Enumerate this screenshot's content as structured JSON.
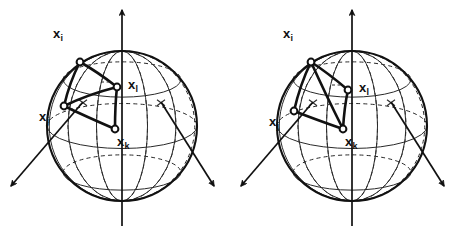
{
  "figure": {
    "name": "sphere-point-configuration-pair",
    "background_color": "#ffffff",
    "ink_color": "#111111",
    "width": 462,
    "height": 232,
    "panel_count": 2
  },
  "labels": {
    "xi": {
      "base": "x",
      "sub": "i"
    },
    "xj": {
      "base": "x",
      "sub": "j"
    },
    "xk": {
      "base": "x",
      "sub": "k"
    },
    "xl": {
      "base": "x",
      "sub": "l"
    }
  },
  "panels": [
    {
      "id": "left-panel",
      "name": "left-sphere-panel",
      "sphere": {
        "cx": 122,
        "cy": 126,
        "r": 75
      },
      "axes": [
        {
          "name": "vertical-axis",
          "from": [
            122,
            226
          ],
          "to": [
            122,
            10
          ]
        },
        {
          "name": "left-diagonal-axis",
          "from": [
            83,
            102
          ],
          "to": [
            11,
            186
          ]
        },
        {
          "name": "right-diagonal-axis",
          "from": [
            161,
            102
          ],
          "to": [
            214,
            186
          ]
        }
      ],
      "vertices": [
        {
          "key": "xi",
          "name": "vertex-xi",
          "x": 80,
          "y": 62,
          "label_x": 53,
          "label_y": 27
        },
        {
          "key": "xl",
          "name": "vertex-xl",
          "x": 117,
          "y": 87,
          "label_x": 128,
          "label_y": 78
        },
        {
          "key": "xj",
          "name": "vertex-xj",
          "x": 64,
          "y": 106,
          "label_x": 39,
          "label_y": 110
        },
        {
          "key": "xk",
          "name": "vertex-xk",
          "x": 115,
          "y": 129,
          "label_x": 117,
          "label_y": 135
        }
      ],
      "edges": [
        {
          "name": "edge-xi-xl",
          "from": "xi",
          "to": "xl"
        },
        {
          "name": "edge-xi-xj",
          "from": "xi",
          "to": "xj"
        },
        {
          "name": "edge-xj-xl",
          "from": "xj",
          "to": "xl"
        },
        {
          "name": "edge-xl-xk",
          "from": "xl",
          "to": "xk"
        },
        {
          "name": "edge-xj-xk",
          "from": "xj",
          "to": "xk"
        }
      ]
    },
    {
      "id": "right-panel",
      "name": "right-sphere-panel",
      "sphere": {
        "cx": 352,
        "cy": 126,
        "r": 75
      },
      "axes": [
        {
          "name": "vertical-axis",
          "from": [
            352,
            226
          ],
          "to": [
            352,
            10
          ]
        },
        {
          "name": "left-diagonal-axis",
          "from": [
            313,
            102
          ],
          "to": [
            241,
            186
          ]
        },
        {
          "name": "right-diagonal-axis",
          "from": [
            391,
            102
          ],
          "to": [
            444,
            186
          ]
        }
      ],
      "vertices": [
        {
          "key": "xi",
          "name": "vertex-xi",
          "x": 311,
          "y": 62,
          "label_x": 283,
          "label_y": 27
        },
        {
          "key": "xl",
          "name": "vertex-xl",
          "x": 348,
          "y": 90,
          "label_x": 359,
          "label_y": 81
        },
        {
          "key": "xj",
          "name": "vertex-xj",
          "x": 294,
          "y": 111,
          "label_x": 269,
          "label_y": 115
        },
        {
          "key": "xk",
          "name": "vertex-xk",
          "x": 343,
          "y": 129,
          "label_x": 345,
          "label_y": 135
        }
      ],
      "edges": [
        {
          "name": "edge-xi-xl",
          "from": "xi",
          "to": "xl"
        },
        {
          "name": "edge-xi-xj",
          "from": "xi",
          "to": "xj"
        },
        {
          "name": "edge-xi-xk",
          "from": "xi",
          "to": "xk"
        },
        {
          "name": "edge-xl-xk",
          "from": "xl",
          "to": "xk"
        },
        {
          "name": "edge-xj-xk",
          "from": "xj",
          "to": "xk"
        }
      ]
    }
  ]
}
